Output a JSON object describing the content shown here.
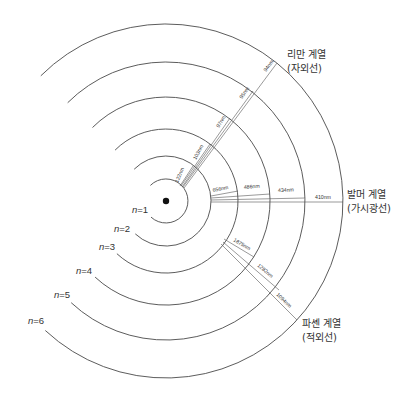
{
  "diagram": {
    "center": {
      "x": 166,
      "y": 201
    },
    "orbits": [
      {
        "n": 1,
        "label": "n=1",
        "radius": 22
      },
      {
        "n": 2,
        "label": "n=2",
        "radius": 45
      },
      {
        "n": 3,
        "label": "n=3",
        "radius": 72
      },
      {
        "n": 4,
        "label": "n=4",
        "radius": 104
      },
      {
        "n": 5,
        "label": "n=5",
        "radius": 139
      },
      {
        "n": 6,
        "label": "n=6",
        "radius": 177
      }
    ],
    "series": [
      {
        "name": "리만 계열",
        "region": "(자외선)",
        "lower_level": 1,
        "transitions": [
          {
            "from": 2,
            "wavelength": "122nm"
          },
          {
            "from": 3,
            "wavelength": "103nm"
          },
          {
            "from": 4,
            "wavelength": "97nm"
          },
          {
            "from": 5,
            "wavelength": "95nm"
          },
          {
            "from": 6,
            "wavelength": "94nm"
          }
        ]
      },
      {
        "name": "발머 계열",
        "region": "(가시광선)",
        "lower_level": 2,
        "transitions": [
          {
            "from": 3,
            "wavelength": "656nm"
          },
          {
            "from": 4,
            "wavelength": "486nm"
          },
          {
            "from": 5,
            "wavelength": "434nm"
          },
          {
            "from": 6,
            "wavelength": "410nm"
          }
        ]
      },
      {
        "name": "파셴 계열",
        "region": "(적외선)",
        "lower_level": 3,
        "transitions": [
          {
            "from": 4,
            "wavelength": "1875nm"
          },
          {
            "from": 5,
            "wavelength": "1282nm"
          },
          {
            "from": 6,
            "wavelength": "1094nm"
          }
        ]
      }
    ],
    "colors": {
      "line": "#4a4a4a",
      "nucleus": "#111111",
      "text": "#333333",
      "background": "#ffffff"
    }
  }
}
